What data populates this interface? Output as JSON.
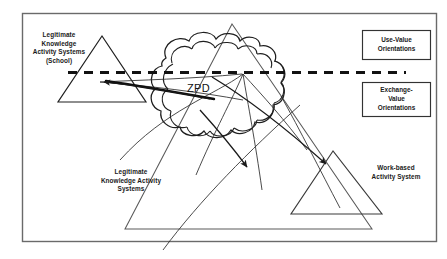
{
  "diagram": {
    "title_text": "ZPD",
    "labels": {
      "school_activity_system": "Legitimate\nKnowledge\nActivity Systems\n(School)",
      "legitimate_activity_systems": "Legitimate\nKnowledge Activity\nSystems",
      "work_based_activity_system": "Work-based\nActivity System",
      "zpd": "ZPD"
    },
    "boxes": [
      {
        "name": "use-value-box",
        "text": "Use-Value\nOrientations"
      },
      {
        "name": "exchange-value-box",
        "text": "Exchange-\nValue\nOrientations"
      }
    ],
    "shapes": {
      "school_triangle": "triangle",
      "bottom_triangle": "triangle",
      "work_triangle": "triangle",
      "zpd_cloud": "cloud",
      "divider": "dashed-line"
    },
    "colors": {
      "stroke": "#1a1a1a",
      "background": "#ffffff",
      "border": "#555555",
      "thin_stroke": "#444444"
    }
  }
}
